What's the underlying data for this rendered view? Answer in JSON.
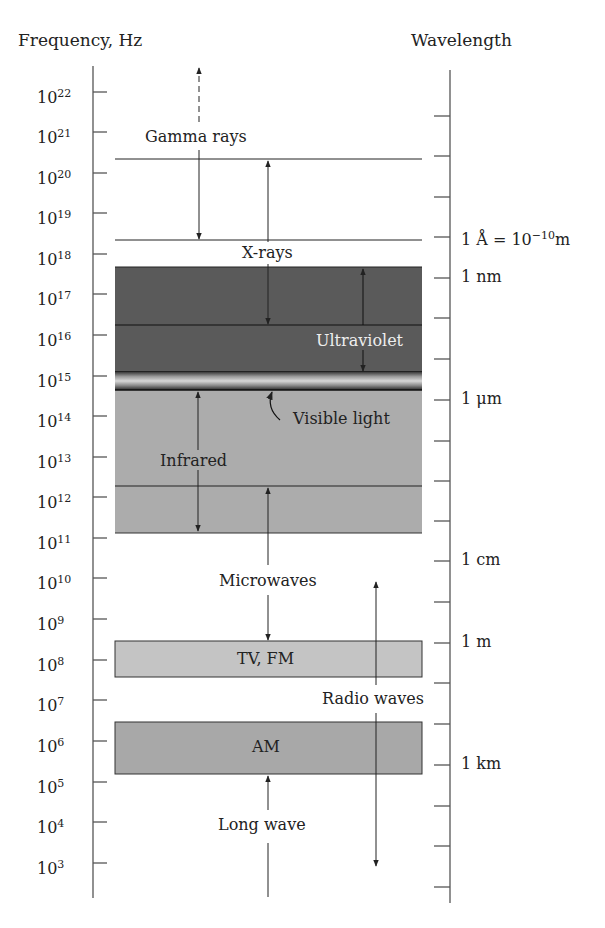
{
  "header": {
    "left_title": "Frequency, Hz",
    "right_title": "Wavelength"
  },
  "frequency_axis": {
    "ticks": [
      {
        "base": "10",
        "exp": "22",
        "y": 92
      },
      {
        "base": "10",
        "exp": "21",
        "y": 132
      },
      {
        "base": "10",
        "exp": "20",
        "y": 173
      },
      {
        "base": "10",
        "exp": "19",
        "y": 213
      },
      {
        "base": "10",
        "exp": "18",
        "y": 254
      },
      {
        "base": "10",
        "exp": "17",
        "y": 294
      },
      {
        "base": "10",
        "exp": "16",
        "y": 335
      },
      {
        "base": "10",
        "exp": "15",
        "y": 376
      },
      {
        "base": "10",
        "exp": "14",
        "y": 416
      },
      {
        "base": "10",
        "exp": "13",
        "y": 457
      },
      {
        "base": "10",
        "exp": "12",
        "y": 497
      },
      {
        "base": "10",
        "exp": "11",
        "y": 538
      },
      {
        "base": "10",
        "exp": "10",
        "y": 578
      },
      {
        "base": "10",
        "exp": "9",
        "y": 619
      },
      {
        "base": "10",
        "exp": "8",
        "y": 660
      },
      {
        "base": "10",
        "exp": "7",
        "y": 700
      },
      {
        "base": "10",
        "exp": "6",
        "y": 741
      },
      {
        "base": "10",
        "exp": "5",
        "y": 782
      },
      {
        "base": "10",
        "exp": "4",
        "y": 822
      },
      {
        "base": "10",
        "exp": "3",
        "y": 863
      }
    ]
  },
  "wavelength_axis": {
    "tick_ys": [
      116,
      156,
      197,
      237,
      278,
      318,
      359,
      400,
      441,
      481,
      521,
      561,
      602,
      643,
      683,
      724,
      765,
      806,
      846,
      887
    ],
    "labels": [
      {
        "text": "1 Å = 10",
        "sup": "−10",
        "suffix": "m",
        "y": 237
      },
      {
        "text": "1 nm",
        "sup": "",
        "suffix": "",
        "y": 278
      },
      {
        "text": "1 μm",
        "sup": "",
        "suffix": "",
        "y": 400
      },
      {
        "text": "1 cm",
        "sup": "",
        "suffix": "",
        "y": 561
      },
      {
        "text": "1 m",
        "sup": "",
        "suffix": "",
        "y": 643
      },
      {
        "text": "1 km",
        "sup": "",
        "suffix": "",
        "y": 765
      }
    ]
  },
  "bands": {
    "gamma_rays": "Gamma rays",
    "x_rays": "X-rays",
    "ultraviolet": "Ultraviolet",
    "visible_light": "Visible light",
    "infrared": "Infrared",
    "microwaves": "Microwaves",
    "tv_fm": "TV, FM",
    "radio_waves": "Radio waves",
    "am": "AM",
    "long_wave": "Long wave"
  },
  "colors": {
    "dark_band": "#5a5a5a",
    "infrared_band": "#acacac",
    "tv_fm_band": "#c4c4c4",
    "am_band": "#a8a8a8",
    "line": "#222222",
    "axis": "#555555",
    "uv_text": "#eeeeee"
  }
}
